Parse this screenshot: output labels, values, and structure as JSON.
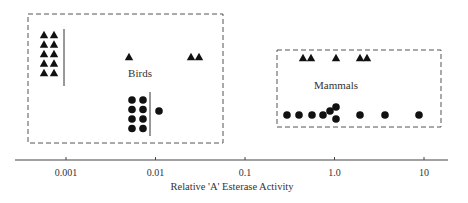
{
  "chart_data": {
    "type": "scatter",
    "title": "",
    "xlabel": "Relative 'A' Esterase Activity",
    "ylabel": "",
    "xscale": "log",
    "xlim": [
      0.00018,
      25
    ],
    "x_ticks": [
      0.001,
      0.01,
      0.1,
      1.0,
      10
    ],
    "x_tick_labels": [
      "0.001",
      "0.01",
      "0.1",
      "1.0",
      "10"
    ],
    "grid": false,
    "legend": null,
    "groups": [
      {
        "name": "Birds",
        "label": "Birds",
        "series": [
          {
            "marker": "triangle",
            "row": "upper",
            "points_x": [
              0.0005,
              0.0005,
              0.0005,
              0.0005,
              0.0005,
              0.0006,
              0.0006,
              0.0006,
              0.0006,
              0.0006,
              0.0053,
              0.023,
              0.028
            ],
            "note": "10 triangles stacked at or below detection limit (< ~0.001), separated by vertical bar"
          },
          {
            "marker": "circle",
            "row": "lower",
            "points_x": [
              0.0068,
              0.0068,
              0.0068,
              0.0068,
              0.0088,
              0.0088,
              0.0088,
              0.0088,
              0.0123
            ],
            "note": "8 circles stacked at or below ~0.008 limit, separated by vertical bar"
          }
        ]
      },
      {
        "name": "Mammals",
        "label": "Mammals",
        "series": [
          {
            "marker": "triangle",
            "row": "upper",
            "points_x": [
              0.55,
              0.68,
              1.0,
              1.85,
              2.2
            ]
          },
          {
            "marker": "circle",
            "row": "lower",
            "points_x": [
              0.3,
              0.41,
              0.55,
              0.73,
              0.87,
              1.0,
              1.0,
              1.82,
              3.9,
              9.0
            ]
          }
        ]
      }
    ]
  },
  "axis": {
    "label": "Relative 'A' Esterase Activity",
    "ticks": [
      "0.001",
      "0.01",
      "0.1",
      "1.0",
      "10"
    ]
  },
  "boxes": {
    "birds_label": "Birds",
    "mammals_label": "Mammals"
  }
}
